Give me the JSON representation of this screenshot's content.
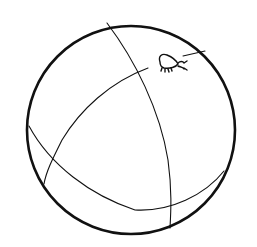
{
  "image": {
    "subject": "Line drawing of a ball with a small bug on it",
    "background_color": "#ffffff",
    "stroke_color": "#111111"
  },
  "ball": {
    "center": [
      131,
      133
    ],
    "radius": 103,
    "outline_width": 2.6,
    "seam_width": 1.1
  },
  "bug": {
    "description": "small caterpillar-like insect on the upper right of the ball"
  }
}
